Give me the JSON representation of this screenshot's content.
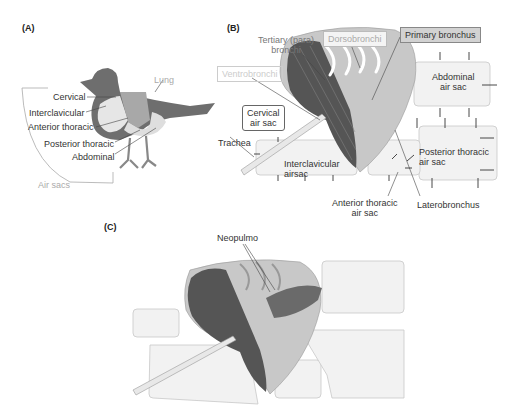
{
  "panel_a": {
    "label": "(A)",
    "labels": {
      "lung": "Lung",
      "cervical": "Cervical",
      "interclavicular": "Interclavicular",
      "anterior_thoracic": "Anterior thoracic",
      "posterior_thoracic": "Posterior thoracic",
      "abdominal": "Abdominal",
      "air_sacs": "Air sacs"
    }
  },
  "panel_b": {
    "label": "(B)",
    "labels": {
      "tertiary_line1": "Tertiary (para)",
      "tertiary_line2": "bronchi",
      "dorsobronchi": "Dorsobronchi",
      "primary_bronchus": "Primary bronchus",
      "ventrobronchi": "Ventrobronchi",
      "cervical_line1": "Cervical",
      "cervical_line2": "air sac",
      "abdominal_line1": "Abdominal",
      "abdominal_line2": "air sac",
      "trachea": "Trachea",
      "interclavicular_line1": "Interclavicular",
      "interclavicular_line2": "airsac",
      "posterior_line1": "Posterior thoracic",
      "posterior_line2": "air sac",
      "anterior_line1": "Anterior thoracic",
      "anterior_line2": "air sac",
      "laterobronchus": "Laterobronchus"
    }
  },
  "panel_c": {
    "label": "(C)",
    "labels": {
      "neopulmo": "Neopulmo"
    }
  },
  "colors": {
    "bird_dark": "#6e6e6e",
    "air_sac_fill": "#f2f2f2",
    "lung_fill": "#c8c8c8",
    "hatch_dark": "#555555",
    "box_border": "#c8c8c8"
  }
}
